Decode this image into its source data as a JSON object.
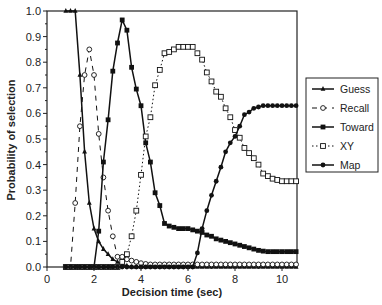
{
  "chart_data": {
    "type": "line",
    "title": "",
    "xlabel": "Decision time (sec)",
    "ylabel": "Probability of selection",
    "xlim": [
      0,
      10.6
    ],
    "ylim": [
      0,
      1.0
    ],
    "xticks": [
      0,
      2,
      4,
      6,
      8,
      10
    ],
    "yticks": [
      0.0,
      0.1,
      0.2,
      0.3,
      0.4,
      0.5,
      0.6,
      0.7,
      0.8,
      0.9,
      1.0
    ],
    "ytick_labels": [
      "0.0",
      "0.1",
      "0.2",
      "0.3",
      "0.4",
      "0.5",
      "0.6",
      "0.7",
      "0.8",
      "0.9",
      "1.0"
    ],
    "grid": false,
    "legend_position": "right-outside",
    "x": [
      0.8,
      1.0,
      1.2,
      1.4,
      1.6,
      1.8,
      2.0,
      2.2,
      2.4,
      2.6,
      2.8,
      3.0,
      3.2,
      3.4,
      3.6,
      3.8,
      4.0,
      4.2,
      4.4,
      4.6,
      4.8,
      5.0,
      5.2,
      5.4,
      5.6,
      5.8,
      6.0,
      6.2,
      6.4,
      6.6,
      6.8,
      7.0,
      7.2,
      7.4,
      7.6,
      7.8,
      8.0,
      8.2,
      8.4,
      8.6,
      8.8,
      9.0,
      9.2,
      9.4,
      9.6,
      9.8,
      10.0,
      10.2,
      10.4,
      10.6
    ],
    "series": [
      {
        "name": "Guess",
        "marker": "triangle-filled",
        "line": "solid",
        "values": [
          1.0,
          1.0,
          1.0,
          0.75,
          0.45,
          0.25,
          0.15,
          0.1,
          0.07,
          0.05,
          0.03,
          0.02,
          0.01,
          0.005,
          0,
          0,
          0,
          0,
          0,
          0,
          0,
          0,
          0,
          0,
          0,
          0,
          0,
          0,
          0,
          0,
          0,
          0,
          0,
          0,
          0,
          0,
          0,
          0,
          0,
          0,
          0,
          0,
          0,
          0,
          0,
          0,
          0,
          0,
          0,
          0
        ]
      },
      {
        "name": "Recall",
        "marker": "circle-open",
        "line": "dashed",
        "values": [
          0,
          0,
          0.25,
          0.55,
          0.75,
          0.85,
          0.75,
          0.52,
          0.35,
          0.22,
          0.12,
          0.04,
          0.04,
          0.03,
          0.025,
          0.02,
          0.015,
          0.012,
          0.01,
          0.01,
          0.01,
          0.01,
          0.01,
          0.01,
          0.01,
          0.01,
          0.01,
          0.01,
          0.01,
          0.01,
          0.01,
          0.01,
          0.01,
          0.01,
          0.01,
          0.01,
          0.01,
          0.01,
          0.01,
          0.01,
          0.01,
          0.01,
          0.01,
          0.01,
          0.01,
          0.01,
          0.01,
          0.01,
          0.01,
          0.01
        ]
      },
      {
        "name": "Toward",
        "marker": "square-filled",
        "line": "solid",
        "values": [
          0,
          0,
          0,
          0,
          0,
          0,
          0,
          0.14,
          0.41,
          0.575,
          0.765,
          0.875,
          0.965,
          0.925,
          0.78,
          0.695,
          0.63,
          0.485,
          0.41,
          0.29,
          0.24,
          0.17,
          0.16,
          0.155,
          0.15,
          0.15,
          0.15,
          0.145,
          0.14,
          0.135,
          0.125,
          0.12,
          0.11,
          0.105,
          0.1,
          0.095,
          0.09,
          0.085,
          0.08,
          0.075,
          0.07,
          0.065,
          0.062,
          0.06,
          0.06,
          0.06,
          0.06,
          0.06,
          0.06,
          0.06
        ]
      },
      {
        "name": "XY",
        "marker": "square-open",
        "line": "dotted",
        "values": [
          0,
          0,
          0,
          0,
          0,
          0,
          0,
          0,
          0,
          0,
          0,
          0,
          0.02,
          0.05,
          0.12,
          0.22,
          0.36,
          0.51,
          0.585,
          0.71,
          0.77,
          0.835,
          0.84,
          0.85,
          0.86,
          0.86,
          0.86,
          0.86,
          0.835,
          0.81,
          0.76,
          0.725,
          0.685,
          0.665,
          0.62,
          0.585,
          0.535,
          0.505,
          0.465,
          0.445,
          0.425,
          0.4,
          0.365,
          0.355,
          0.345,
          0.34,
          0.335,
          0.335,
          0.335,
          0.335
        ]
      },
      {
        "name": "Map",
        "marker": "circle-filled",
        "line": "solid",
        "values": [
          0,
          0,
          0,
          0,
          0,
          0,
          0,
          0,
          0,
          0,
          0,
          0,
          0,
          0,
          0,
          0,
          0,
          0,
          0,
          0,
          0,
          0,
          0,
          0,
          0,
          0,
          0,
          0,
          0.055,
          0.15,
          0.22,
          0.28,
          0.335,
          0.39,
          0.45,
          0.485,
          0.51,
          0.55,
          0.595,
          0.605,
          0.62,
          0.625,
          0.63,
          0.63,
          0.63,
          0.63,
          0.63,
          0.63,
          0.63,
          0.63
        ]
      }
    ]
  },
  "legend": {
    "items": [
      {
        "label": "Guess"
      },
      {
        "label": "Recall"
      },
      {
        "label": "Toward"
      },
      {
        "label": "XY"
      },
      {
        "label": "Map"
      }
    ]
  },
  "colors": {
    "line": "#111111",
    "axis": "#222222",
    "background": "#ffffff"
  }
}
